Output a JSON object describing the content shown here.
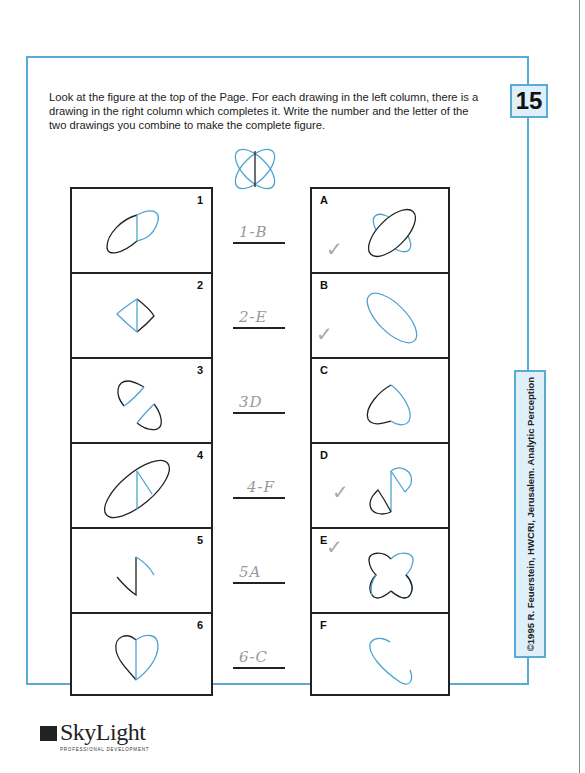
{
  "page": {
    "number": "15",
    "instructions": "Look at the figure at the top of the Page. For each drawing in the left column, there is a drawing in the right column which completes it. Write the number and the letter of the two drawings you combine to make the complete figure.",
    "copyright": "©1995 R. Feuerstein, HWCRI, Jerusalem. Analytic Perception"
  },
  "colors": {
    "frame": "#5aaad6",
    "blue_stroke": "#4fa3d1",
    "black_stroke": "#222222",
    "pencil": "#9a9a9a"
  },
  "left_column": [
    {
      "label": "1",
      "drawing": "ellipse-half-black-left-with-blue-vertical"
    },
    {
      "label": "2",
      "drawing": "kite-blue-left-black-right"
    },
    {
      "label": "3",
      "drawing": "two-wedges"
    },
    {
      "label": "4",
      "drawing": "black-ellipse-blue-wedge"
    },
    {
      "label": "5",
      "drawing": "zigzag"
    },
    {
      "label": "6",
      "drawing": "heart-black-left-blue-right"
    }
  ],
  "right_column": [
    {
      "label": "A",
      "drawing": "black-ellipse-over-blue-petals",
      "checked": true
    },
    {
      "label": "B",
      "drawing": "blue-ellipse",
      "checked": true
    },
    {
      "label": "C",
      "drawing": "heart-outline",
      "checked": false
    },
    {
      "label": "D",
      "drawing": "two-wedges-s-shape",
      "checked": true
    },
    {
      "label": "E",
      "drawing": "four-lobed-shape",
      "checked": true
    },
    {
      "label": "F",
      "drawing": "blue-open-ellipse",
      "checked": false
    }
  ],
  "answers": [
    {
      "text": "1-B"
    },
    {
      "text": "2-E"
    },
    {
      "text": "3D"
    },
    {
      "text": "4-F"
    },
    {
      "text": "5A"
    },
    {
      "text": "6-C"
    }
  ],
  "check_mark": "✓",
  "logo": {
    "name": "SkyLight",
    "tagline": "PROFESSIONAL DEVELOPMENT"
  }
}
